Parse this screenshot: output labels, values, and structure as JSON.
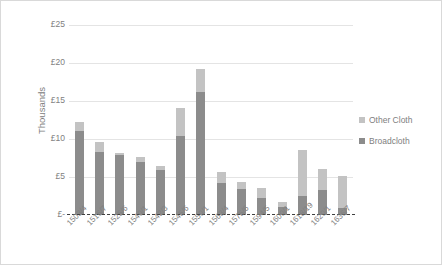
{
  "chart_data": {
    "type": "bar",
    "subtype": "stacked-column",
    "title": "",
    "xlabel": "",
    "ylabel": "Thousands",
    "ylim": [
      0,
      25
    ],
    "ytick_values": [
      0,
      5,
      10,
      15,
      20,
      25
    ],
    "ytick_labels": [
      "£-",
      "£5",
      "£10",
      "£15",
      "£20",
      "£25"
    ],
    "grid": true,
    "legend_position": "right",
    "units": "thousands of pounds",
    "categories": [
      "1503/4",
      "1516/7",
      "1525/6",
      "1540/1",
      "1542/3",
      "1545/6",
      "1550/1",
      "1563/4",
      "1575/6",
      "1594/5",
      "1600/1",
      "1618/19",
      "1620/1",
      "1636/7"
    ],
    "series": [
      {
        "name": "Broadcloth",
        "color": "#8c8c8c",
        "values": [
          11.1,
          8.3,
          7.9,
          7.0,
          5.9,
          10.4,
          16.2,
          4.2,
          3.4,
          2.2,
          1.1,
          2.5,
          3.3,
          0.9
        ]
      },
      {
        "name": "Other Cloth",
        "color": "#c3c3c3",
        "values": [
          1.1,
          1.3,
          0.3,
          0.7,
          0.6,
          3.7,
          3.0,
          1.5,
          1.0,
          1.3,
          0.6,
          6.1,
          2.8,
          4.3
        ]
      }
    ],
    "totals": [
      12.2,
      9.6,
      8.2,
      7.7,
      6.5,
      14.1,
      19.2,
      5.7,
      4.4,
      3.5,
      1.7,
      8.6,
      6.1,
      5.2
    ]
  },
  "legend": {
    "items": [
      {
        "label": "Other Cloth",
        "color": "#c3c3c3"
      },
      {
        "label": "Broadcloth",
        "color": "#8c8c8c"
      }
    ]
  },
  "colors": {
    "broadcloth": "#8c8c8c",
    "other_cloth": "#c3c3c3",
    "gridline": "#e4e4e4",
    "axis": "#3f3f3f",
    "text": "#808080",
    "border": "#d9d9d9",
    "background": "#ffffff"
  }
}
